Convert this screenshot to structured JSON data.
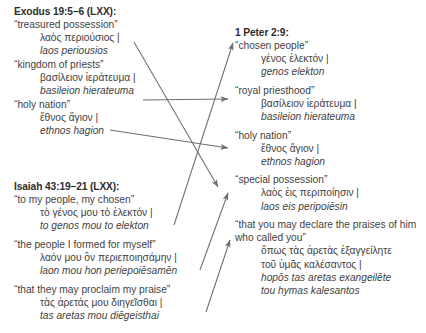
{
  "diagram": {
    "title_visible": false,
    "line_color": "#6b6f73",
    "text_color": "#3f3f3f",
    "heading_color": "#2e2e2e",
    "background": "#ffffff"
  },
  "columns": {
    "left": [
      {
        "heading": "Exodus 19:5–6 (LXX):",
        "entries": [
          {
            "english": "“treasured possession”",
            "greek": "λαὸς περιούσιος |",
            "translit": "laos periousios"
          },
          {
            "english": "“kingdom of priests”",
            "greek": "βασίλειον ἱεράτευμα |",
            "translit": "basileion hierateuma"
          },
          {
            "english": "“holy nation”",
            "greek": "ἔθνος ἅγιον |",
            "translit": "ethnos hagion"
          }
        ]
      },
      {
        "heading": "Isaiah 43:19–21 (LXX):",
        "entries": [
          {
            "english": "“to my people, my chosen”",
            "greek": "τὸ γένος μου τὸ ἐλεκτόν |",
            "translit": "to genos mou to elekton"
          },
          {
            "english": "“the people I formed for myself”",
            "greek": "λαόν μου ὃν περιεποιησάμην |",
            "translit": "laon mou hon periepoiēsamēn"
          },
          {
            "english": "“that they may proclaim my praise”",
            "greek": "τὰς ἀρετάς μου διηγεῖσθαι |",
            "translit": "tas aretas mou diēgeisthai"
          }
        ]
      }
    ],
    "right": [
      {
        "heading": "1 Peter 2:9:",
        "entries": [
          {
            "english": "“chosen people”",
            "greek": "γένος ἐλεκτόν |",
            "translit": "genos elekton"
          },
          {
            "english": "“royal priesthood”",
            "greek": "βασίλειον ἱεράτευμα |",
            "translit": "basileion hierateuma"
          },
          {
            "english": "“holy nation”",
            "greek": "ἔθνος ἅγιον |",
            "translit": "ethnos hagion"
          },
          {
            "english": "“special possession”",
            "greek": "λαὸς ἐις περιποίησιν |",
            "translit": "laos eis peripoiēsin"
          },
          {
            "english": "“that you may declare the praises of him who called you”",
            "greek": "ὅπως τὰς ἀρετὰς ἐξαγγείλητε",
            "greek2": "τοῦ ὑμᾶς καλέσαντος |",
            "translit": "hopōs tas aretas exangeilēte",
            "translit2": "tou hymas kalesantos"
          }
        ]
      }
    ]
  },
  "connections": [
    {
      "name": "exodus-treasured-to-special-possession",
      "from": "laos periousios",
      "to": "special possession"
    },
    {
      "name": "exodus-kingdom-to-royal-priesthood",
      "from": "basileion hierateuma",
      "to": "royal priesthood"
    },
    {
      "name": "exodus-holy-to-holy-nation",
      "from": "ethnos hagion",
      "to": "holy nation"
    },
    {
      "name": "isaiah-chosen-to-chosen-people",
      "from": "to genos mou to elekton",
      "to": "chosen people"
    },
    {
      "name": "isaiah-formed-to-special-possession",
      "from": "laon mou hon periepoiesamen",
      "to": "special possession"
    },
    {
      "name": "isaiah-praise-to-declare-praises",
      "from": "tas aretas mou diegeisthai",
      "to": "that you may declare the praises"
    }
  ]
}
